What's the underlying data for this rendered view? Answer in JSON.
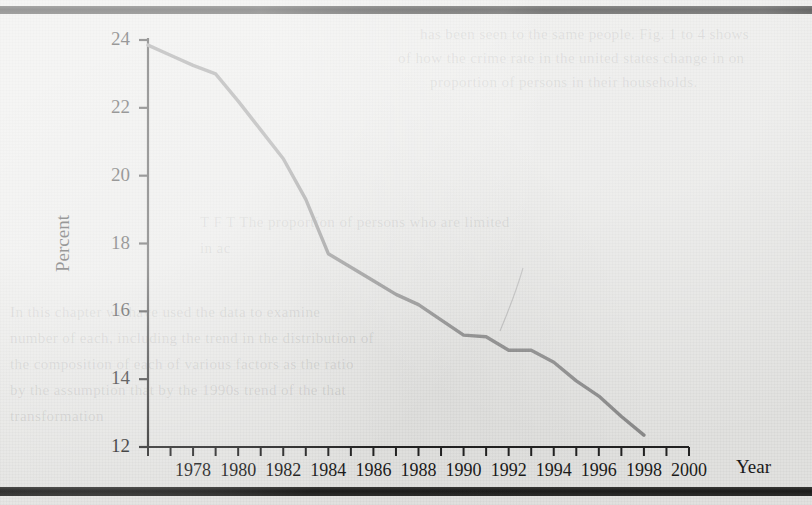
{
  "figure": {
    "ylabel": "Percent",
    "xlabel": "Year"
  },
  "showthrough_lines": [
    "has been seen to the same people. Fig. 1 to 4 shows",
    "of how the crime rate in the united states change in on",
    "proportion of persons in their households.",
    "T  F    T  The proportion of persons who are limited",
    "in ac",
    "In this chapter we have used the data to examine",
    "number of each, including the trend in the distribution of",
    "the composition of each of various factors as the ratio",
    "by the  assumption that  by the  1990s  trend of the  that",
    "transformation"
  ],
  "chart_data": {
    "type": "line",
    "title": "",
    "subtitle": "",
    "xlabel": "Year",
    "ylabel": "Percent",
    "xlim": [
      1976,
      2000
    ],
    "ylim": [
      12,
      24
    ],
    "grid": false,
    "legend": null,
    "axis": {
      "y_ticks": [
        12,
        14,
        16,
        18,
        20,
        22,
        24
      ],
      "y_tick_labels": [
        "12",
        "14",
        "16",
        "18",
        "20",
        "22",
        "24"
      ],
      "x_ticks": [
        1976,
        1977,
        1978,
        1979,
        1980,
        1981,
        1982,
        1983,
        1984,
        1985,
        1986,
        1987,
        1988,
        1989,
        1990,
        1991,
        1992,
        1993,
        1994,
        1995,
        1996,
        1997,
        1998,
        1999,
        2000
      ],
      "x_tick_labels": [
        "1978",
        "1980",
        "1982",
        "1984",
        "1986",
        "1988",
        "1990",
        "1992",
        "1994",
        "1996",
        "1998",
        "2000"
      ],
      "x_labeled_ticks": [
        1978,
        1980,
        1982,
        1984,
        1986,
        1988,
        1990,
        1992,
        1994,
        1996,
        1998,
        2000
      ]
    },
    "line_color": "#8c8c8c",
    "line_width": 3.4,
    "x": [
      1976,
      1977,
      1978,
      1979,
      1980,
      1981,
      1982,
      1983,
      1984,
      1985,
      1986,
      1987,
      1988,
      1989,
      1990,
      1991,
      1992,
      1993,
      1994,
      1995,
      1996,
      1997,
      1998
    ],
    "values": [
      23.85,
      23.55,
      23.25,
      23.0,
      22.2,
      21.35,
      20.5,
      19.3,
      17.7,
      17.3,
      16.9,
      16.5,
      16.2,
      15.75,
      15.3,
      15.25,
      14.85,
      14.85,
      14.5,
      13.95,
      13.5,
      12.9,
      12.35
    ],
    "series": [
      {
        "name": "Percent",
        "x": [
          1976,
          1977,
          1978,
          1979,
          1980,
          1981,
          1982,
          1983,
          1984,
          1985,
          1986,
          1987,
          1988,
          1989,
          1990,
          1991,
          1992,
          1993,
          1994,
          1995,
          1996,
          1997,
          1998
        ],
        "values": [
          23.85,
          23.55,
          23.25,
          23.0,
          22.2,
          21.35,
          20.5,
          19.3,
          17.7,
          17.3,
          16.9,
          16.5,
          16.2,
          15.75,
          15.3,
          15.25,
          14.85,
          14.85,
          14.5,
          13.95,
          13.5,
          12.9,
          12.35
        ]
      }
    ],
    "annotations": []
  }
}
